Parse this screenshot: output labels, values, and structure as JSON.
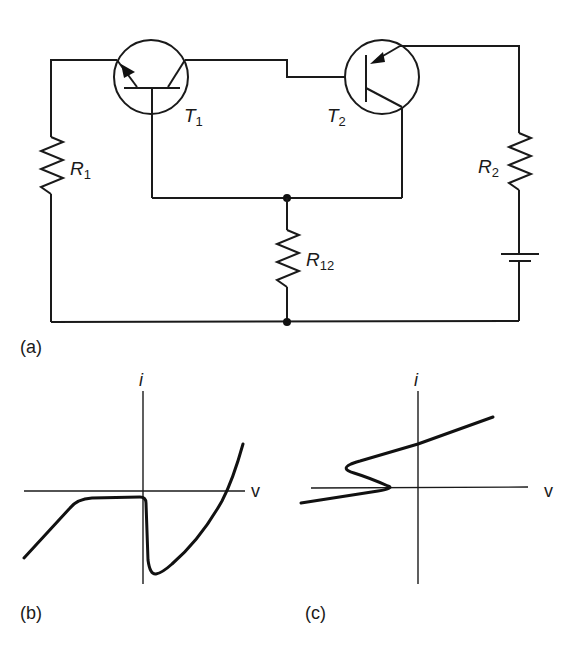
{
  "figure": {
    "panel_a": {
      "label": "(a)",
      "components": {
        "T1": {
          "name": "T",
          "sub": "1",
          "type": "npn-style transistor (emitter arrow inward)"
        },
        "T2": {
          "name": "T",
          "sub": "2",
          "type": "pnp transistor"
        },
        "R1": {
          "name": "R",
          "sub": "1"
        },
        "R2": {
          "name": "R",
          "sub": "2"
        },
        "R12": {
          "name": "R",
          "sub": "12"
        },
        "battery": {
          "name": "battery"
        }
      }
    },
    "panel_b": {
      "label": "(b)",
      "x_axis": "v",
      "y_axis": "i"
    },
    "panel_c": {
      "label": "(c)",
      "x_axis": "v",
      "y_axis": "i"
    },
    "colors": {
      "ink": "#1a1a1a",
      "background": "#ffffff"
    }
  }
}
